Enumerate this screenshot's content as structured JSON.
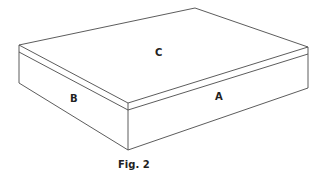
{
  "figure": {
    "caption": "Fig. 2",
    "faces": {
      "top": {
        "label": "C"
      },
      "left": {
        "label": "B"
      },
      "right": {
        "label": "A"
      }
    },
    "colors": {
      "line": "#4a4a4a",
      "text": "#222222",
      "background": "#ffffff"
    }
  }
}
